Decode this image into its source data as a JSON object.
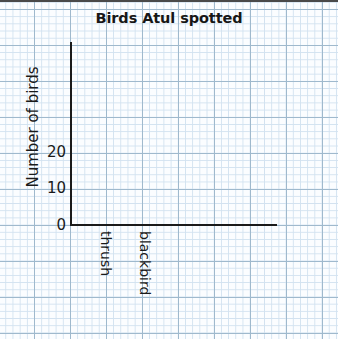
{
  "chart_data": {
    "type": "bar",
    "title": "Birds Atul spotted",
    "xlabel": "",
    "ylabel": "Number of birds",
    "categories": [
      "thrush",
      "blackbird"
    ],
    "values": [
      null,
      null
    ],
    "series": [
      {
        "name": "Number of birds",
        "values": [
          null,
          null
        ]
      }
    ],
    "ytick_labels": [
      "0",
      "10",
      "20"
    ],
    "ytick_values": [
      0,
      10,
      20
    ],
    "ylim": [
      0,
      30
    ],
    "grid": "graph-paper",
    "grid_minor_px": 7.2,
    "grid_major_px": 36,
    "legend": "none"
  },
  "colors": {
    "paper_background": "#fbfdff",
    "grid_minor": "#d2e2f0",
    "grid_major": "#9fb9cd",
    "axis_line": "#1a1a1a",
    "text": "#1a1a1a",
    "top_border": "#4a4a4a"
  }
}
